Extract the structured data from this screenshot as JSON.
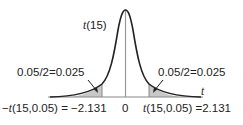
{
  "diagram": {
    "type": "t-distribution density curve",
    "curve_label": "t (15)",
    "curve_label_var": "t",
    "curve_label_df": "(15)",
    "axis_label": "t",
    "center_tick": "0",
    "left_tail": {
      "area_label": "0.05/2=0.025",
      "critical_label_prefix": "−",
      "critical_label_var": "t",
      "critical_label_rest": "(15,0.05) = −2.131"
    },
    "right_tail": {
      "area_label": "0.05/2=0.025",
      "critical_label_var": "t",
      "critical_label_rest": "(15,0.05) =2.131"
    },
    "colors": {
      "curve": "#222222",
      "axis": "#888888",
      "shade": "#c8c8c8"
    }
  }
}
